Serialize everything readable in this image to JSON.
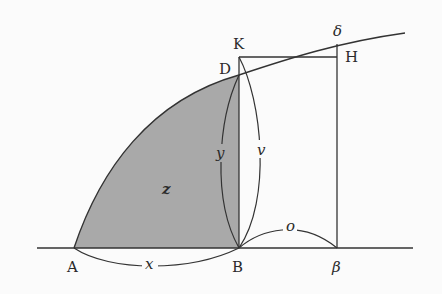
{
  "diagram": {
    "colors": {
      "stroke": "#333333",
      "fill": "#a9a9a9",
      "background": "#fbfbfb"
    },
    "points": {
      "A": "A",
      "B": "B",
      "beta": "β",
      "K": "K",
      "D": "D",
      "H": "H",
      "delta": "δ"
    },
    "arcs": {
      "x": "x",
      "y": "y",
      "v": "v",
      "o": "o"
    },
    "region": {
      "z": "z"
    }
  }
}
